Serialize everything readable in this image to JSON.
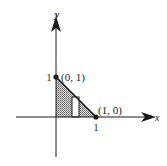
{
  "figure": {
    "type": "region-diagram",
    "axes": {
      "x_label": "x",
      "y_label": "y"
    },
    "ticks": {
      "x_tick": "1",
      "y_tick": "1"
    },
    "points": [
      {
        "label": "(0, 1)",
        "x": 0,
        "y": 1
      },
      {
        "label": "(1, 0)",
        "x": 1,
        "y": 0
      }
    ],
    "region": {
      "description": "Triangle bounded by x-axis, y-axis and line x + y = 1",
      "fill": "stippled gray"
    },
    "representative_rectangle": {
      "description": "vertical strip under line y = 1 - x",
      "fill": "white"
    },
    "colors": {
      "ink": "#1a1a1a",
      "shade": "#9a9a9a",
      "background": "#ffffff"
    }
  }
}
